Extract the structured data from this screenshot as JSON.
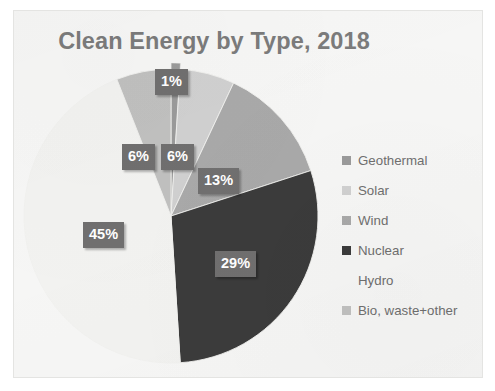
{
  "chart_data": {
    "type": "pie",
    "title": "Clean Energy by Type, 2018",
    "categories": [
      "Geothermal",
      "Solar",
      "Wind",
      "Nuclear",
      "Hydro",
      "Bio, waste+other"
    ],
    "values": [
      1,
      6,
      13,
      29,
      45,
      6
    ],
    "labels": [
      "1%",
      "6%",
      "13%",
      "29%",
      "45%",
      "6%"
    ],
    "unit": "%",
    "legend_position": "right",
    "grid": false,
    "xlabel": "",
    "ylabel": "",
    "slice_colors": [
      "#9a9a9a",
      "#d0d0d0",
      "#a9a9a9",
      "#3b3b3b",
      "#f2f2f0",
      "#c0c0bf"
    ],
    "start_angle_deg": 0,
    "direction": "clockwise",
    "slices": [
      {
        "name": "Geothermal",
        "value": 1,
        "label": "1%",
        "color": "#9a9a9a"
      },
      {
        "name": "Solar",
        "value": 6,
        "label": "6%",
        "color": "#d0d0d0"
      },
      {
        "name": "Wind",
        "value": 13,
        "label": "13%",
        "color": "#a9a9a9"
      },
      {
        "name": "Nuclear",
        "value": 29,
        "label": "29%",
        "color": "#3b3b3b"
      },
      {
        "name": "Hydro",
        "value": 45,
        "label": "45%",
        "color": "#f2f2f0"
      },
      {
        "name": "Bio, waste+other",
        "value": 6,
        "label": "6%",
        "color": "#c0c0bf"
      }
    ]
  },
  "chart": {
    "title": "Clean Energy by Type, 2018",
    "labels": {
      "geothermal": "1%",
      "solar": "6%",
      "wind": "13%",
      "nuclear": "29%",
      "hydro": "45%",
      "bio": "6%"
    }
  },
  "legend": {
    "items": [
      {
        "label": "Geothermal",
        "color": "#9a9a9a"
      },
      {
        "label": "Solar",
        "color": "#d0d0d0"
      },
      {
        "label": "Wind",
        "color": "#a9a9a9"
      },
      {
        "label": "Nuclear",
        "color": "#3b3b3b"
      },
      {
        "label": "Hydro",
        "color": "#f2f2f0"
      },
      {
        "label": "Bio, waste+other",
        "color": "#c0c0bf"
      }
    ]
  },
  "colors": {
    "slide_background": "#f6f6f5",
    "title_text": "#7b7b7b",
    "legend_text": "#6f6f6f",
    "data_label_background": "#706f6f",
    "data_label_text": "#ffffff"
  }
}
